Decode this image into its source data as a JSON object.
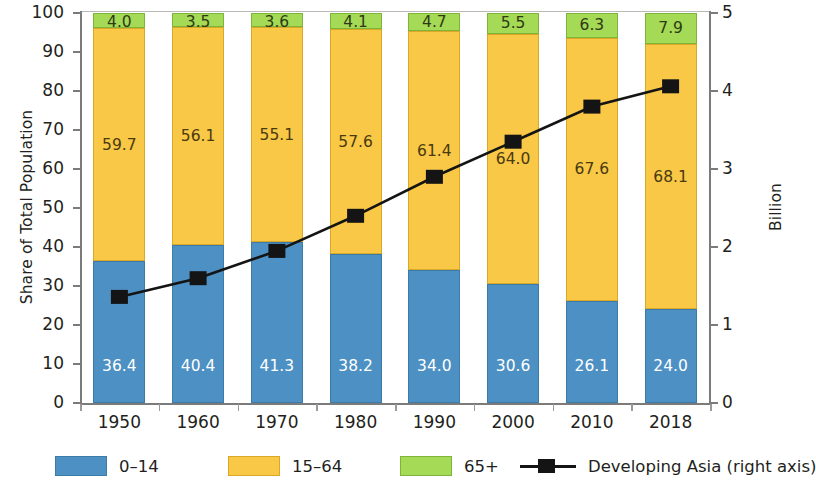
{
  "chart_data": {
    "type": "bar",
    "subtype": "stacked-bar-with-line",
    "title": "",
    "xlabel": "",
    "ylabel": "Share of Total Population",
    "y2label": "Billion",
    "ylim": [
      0,
      100
    ],
    "y2lim": [
      0,
      5
    ],
    "grid": false,
    "legend_position": "bottom",
    "categories": [
      "1950",
      "1960",
      "1970",
      "1980",
      "1990",
      "2000",
      "2010",
      "2018"
    ],
    "y_ticks": [
      "0",
      "10",
      "20",
      "30",
      "40",
      "50",
      "60",
      "70",
      "80",
      "90",
      "100"
    ],
    "y2_ticks": [
      "0",
      "1",
      "2",
      "3",
      "4",
      "5"
    ],
    "series": [
      {
        "name": "0–14",
        "color": "#4d90c4",
        "axis": "left",
        "values": [
          36.4,
          40.4,
          41.3,
          38.2,
          34.0,
          30.6,
          26.1,
          24.0
        ],
        "labels": [
          "36.4",
          "40.4",
          "41.3",
          "38.2",
          "34.0",
          "30.6",
          "26.1",
          "24.0"
        ]
      },
      {
        "name": "15–64",
        "color": "#f8c846",
        "axis": "left",
        "values": [
          59.7,
          56.1,
          55.1,
          57.6,
          61.4,
          64.0,
          67.6,
          68.1
        ],
        "labels": [
          "59.7",
          "56.1",
          "55.1",
          "57.6",
          "61.4",
          "64.0",
          "67.6",
          "68.1"
        ]
      },
      {
        "name": "65+",
        "color": "#a4da56",
        "axis": "left",
        "values": [
          4.0,
          3.5,
          3.6,
          4.1,
          4.7,
          5.5,
          6.3,
          7.9
        ],
        "labels": [
          "4.0",
          "3.5",
          "3.6",
          "4.1",
          "4.7",
          "5.5",
          "6.3",
          "7.9"
        ]
      },
      {
        "name": "Developing Asia (right axis)",
        "color": "#141414",
        "axis": "right",
        "marker": "square",
        "values": [
          1.36,
          1.6,
          1.95,
          2.4,
          2.9,
          3.35,
          3.8,
          4.06
        ]
      }
    ]
  },
  "axes": {
    "left_title": "Share of Total Population",
    "right_title": "Billion"
  },
  "legend": {
    "items": [
      {
        "label": "0–14",
        "swatch": "blue-swatch"
      },
      {
        "label": "15–64",
        "swatch": "yellow-swatch"
      },
      {
        "label": "65+",
        "swatch": "green-swatch"
      },
      {
        "label": "Developing Asia (right axis)",
        "swatch": "black-line-square-marker"
      }
    ]
  }
}
